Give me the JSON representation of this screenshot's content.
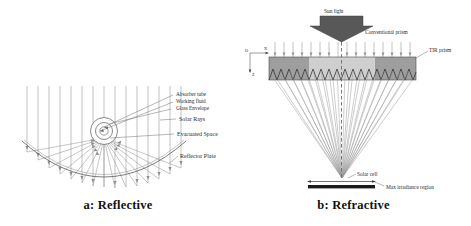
{
  "figure": {
    "title_a": "a: Reflective",
    "title_b": "b: Refractive"
  },
  "panel_a": {
    "name": "reflective-concentrator",
    "labels": {
      "absorber_tube": "Absorber tube",
      "working_fluid": "Working fluid",
      "glass_envelope": "Glass Envelope",
      "solar_rays": "Solar Rays",
      "evacuated_space": "Evacuated Space",
      "reflector_plate": "Reflector Plate"
    }
  },
  "panel_b": {
    "name": "refractive-concentrator",
    "labels": {
      "sun_light": "Sun light",
      "conventional_prism": "Conventional prism",
      "tir_prism": "TIR prism",
      "solar_cell": "Solar cell",
      "max_irradiance_region": "Max irradiance region"
    },
    "axes": {
      "origin": "O",
      "x": "X",
      "z": "Z"
    }
  },
  "colors": {
    "line": "#3a3a3a",
    "ray": "#8a8a8a",
    "text": "#2b2b2b",
    "arrow_fill": "#585858",
    "tir_prism_fill": "#9e9e9e",
    "conventional_prism_fill": "#cfcfcf",
    "solar_cell_fill": "#1a1a1a",
    "background": "#ffffff"
  }
}
